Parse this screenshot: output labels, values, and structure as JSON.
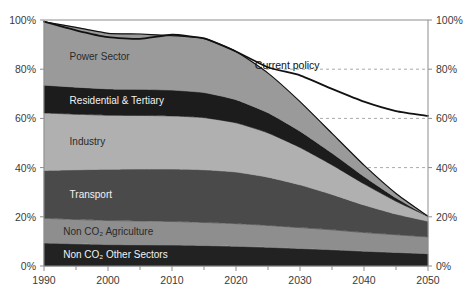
{
  "chart_data": {
    "type": "area",
    "title": "",
    "xlabel": "",
    "ylabel": "",
    "xlim": [
      1990,
      2050
    ],
    "ylim": [
      0,
      100
    ],
    "grid": true,
    "grid_values": [
      40,
      60,
      80
    ],
    "legend_position": "inline-labels",
    "stacked": true,
    "stack_order": "bottom-to-top",
    "x": [
      1990,
      1995,
      2000,
      2005,
      2010,
      2015,
      2020,
      2025,
      2030,
      2035,
      2040,
      2045,
      2050
    ],
    "y_ticks_left": [
      "0%",
      "20%",
      "40%",
      "60%",
      "80%",
      "100%"
    ],
    "y_ticks_right": [
      "0%",
      "20%",
      "40%",
      "60%",
      "80%",
      "100%"
    ],
    "x_ticks": [
      "1990",
      "2000",
      "2010",
      "2020",
      "2030",
      "2040",
      "2050"
    ],
    "x_tick_values": [
      1990,
      2000,
      2010,
      2020,
      2030,
      2040,
      2050
    ],
    "x_minor_values": [
      1995,
      2005,
      2015,
      2025,
      2035,
      2045
    ],
    "series": [
      {
        "name": "Non CO2 Other Sectors",
        "label": "Non CO₂ Other Sectors",
        "color": "#222222",
        "label_color": "on-dark",
        "values": [
          9.3,
          9.0,
          8.7,
          8.6,
          8.5,
          8.3,
          8.0,
          7.6,
          7.1,
          6.6,
          6.0,
          5.5,
          5.0
        ]
      },
      {
        "name": "Non CO2 Agriculture",
        "label": "Non CO₂ Agriculture",
        "color": "#8e8e8e",
        "label_color": "on-light",
        "values": [
          10.1,
          9.9,
          9.8,
          9.7,
          9.6,
          9.4,
          9.2,
          8.9,
          8.5,
          8.1,
          7.6,
          7.2,
          6.8
        ]
      },
      {
        "name": "Transport",
        "label": "Transport",
        "color": "#4a4a4a",
        "label_color": "on-dark",
        "values": [
          19.4,
          20.2,
          20.8,
          21.1,
          21.3,
          21.4,
          21.0,
          19.6,
          17.4,
          14.4,
          11.2,
          8.4,
          6.4
        ]
      },
      {
        "name": "Industry",
        "label": "Industry",
        "color": "#b0b0b0",
        "label_color": "on-light",
        "values": [
          23.4,
          22.6,
          22.0,
          21.8,
          21.6,
          21.2,
          20.0,
          18.0,
          15.2,
          12.0,
          8.6,
          5.2,
          2.0
        ]
      },
      {
        "name": "Residential & Tertiary",
        "label": "Residential & Tertiary",
        "color": "#1c1c1c",
        "label_color": "on-dark",
        "values": [
          11.3,
          11.0,
          10.7,
          10.6,
          10.5,
          10.2,
          9.4,
          8.2,
          6.6,
          4.8,
          3.0,
          1.4,
          0.0
        ]
      },
      {
        "name": "Power Sector",
        "label": "Power Sector",
        "color": "#9a9a9a",
        "label_color": "on-light",
        "values": [
          25.8,
          24.3,
          22.6,
          22.5,
          22.1,
          22.0,
          19.6,
          16.1,
          12.0,
          8.0,
          4.6,
          1.8,
          0.0
        ]
      }
    ],
    "annotations": [
      {
        "name": "current-policy",
        "label": "Current policy",
        "color": "#111111",
        "values": [
          99.3,
          95.8,
          93.0,
          92.3,
          94.0,
          92.5,
          87.2,
          80.8,
          77.5,
          72.0,
          66.8,
          63.0,
          61.0
        ],
        "label_x": 2028,
        "label_y": 80
      }
    ]
  }
}
